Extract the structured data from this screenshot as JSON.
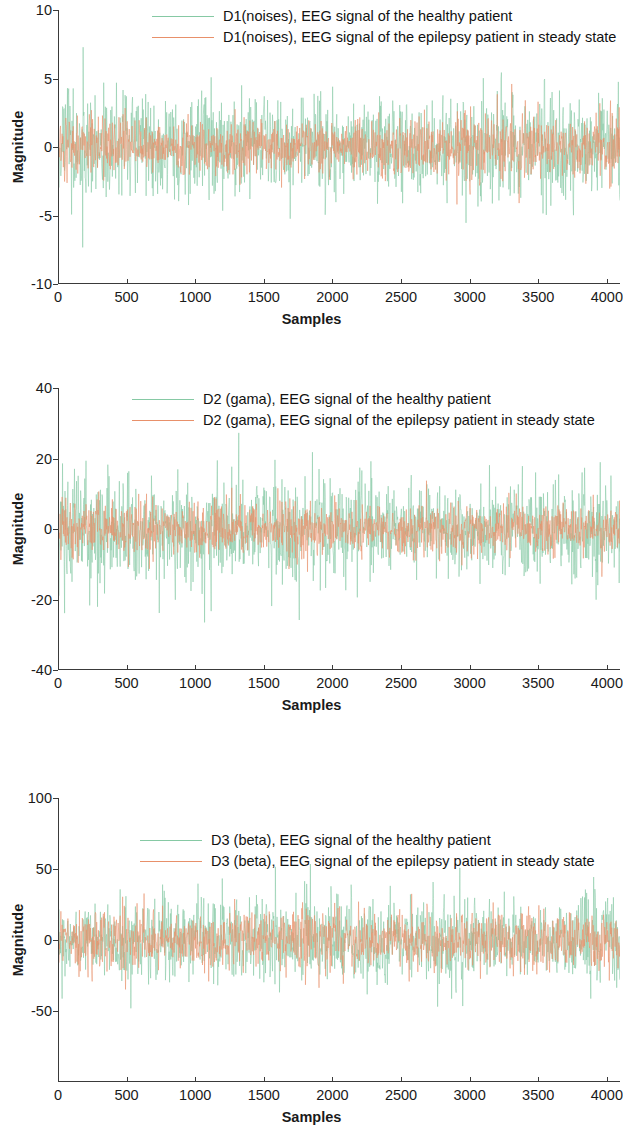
{
  "figure": {
    "background": "#ffffff",
    "series_colors": {
      "healthy": "#86c9a4",
      "epilepsy": "#e8906a"
    }
  },
  "chart_data": [
    {
      "type": "line",
      "id": "d1",
      "title": "",
      "xlabel": "Samples",
      "ylabel": "Magnitude",
      "xlim": [
        0,
        4096
      ],
      "ylim": [
        -10,
        10
      ],
      "xticks": [
        0,
        500,
        1000,
        1500,
        2000,
        2500,
        3000,
        3500,
        4000
      ],
      "xticklabels": [
        "0",
        "500",
        "1000",
        "1500",
        "2000",
        "2500",
        "3000",
        "3500",
        "4000"
      ],
      "yticks": [
        10,
        5,
        0,
        -5,
        -10
      ],
      "yticklabels": [
        "10",
        "5",
        "0",
        "-5",
        "-10"
      ],
      "grid": false,
      "legend_position": "top-center",
      "series": [
        {
          "name": "D1(noises), EEG signal of the healthy patient",
          "color": "#86c9a4",
          "amplitude": 4.2,
          "peak": 8.9,
          "seed": 11,
          "roughness": 0.95,
          "npoints": 4096
        },
        {
          "name": "D1(noises), EEG signal of the epilepsy patient in steady state",
          "color": "#e8906a",
          "amplitude": 1.9,
          "peak": 4.6,
          "seed": 23,
          "roughness": 0.9,
          "npoints": 4096
        }
      ]
    },
    {
      "type": "line",
      "id": "d2",
      "title": "",
      "xlabel": "Samples",
      "ylabel": "Magnitude",
      "xlim": [
        0,
        4096
      ],
      "ylim": [
        -40,
        40
      ],
      "xticks": [
        0,
        500,
        1000,
        1500,
        2000,
        2500,
        3000,
        3500,
        4000
      ],
      "xticklabels": [
        "0",
        "500",
        "1000",
        "1500",
        "2000",
        "2500",
        "3000",
        "3500",
        "4000"
      ],
      "yticks": [
        40,
        20,
        0,
        -20,
        -40
      ],
      "yticklabels": [
        "40",
        "20",
        "0",
        "-20",
        "-40"
      ],
      "grid": false,
      "legend_position": "top-center",
      "series": [
        {
          "name": "D2 (gama), EEG signal of the healthy patient",
          "color": "#86c9a4",
          "amplitude": 14.5,
          "peak": 33,
          "seed": 37,
          "roughness": 0.85,
          "npoints": 4096
        },
        {
          "name": "D2 (gama), EEG signal of the epilepsy patient in steady state",
          "color": "#e8906a",
          "amplitude": 6.5,
          "peak": 16,
          "seed": 53,
          "roughness": 0.8,
          "npoints": 4096
        }
      ]
    },
    {
      "type": "line",
      "id": "d3",
      "title": "",
      "xlabel": "Samples",
      "ylabel": "Magnitude",
      "xlim": [
        0,
        4096
      ],
      "ylim": [
        -100,
        100
      ],
      "xticks": [
        0,
        500,
        1000,
        1500,
        2000,
        2500,
        3000,
        3500,
        4000
      ],
      "xticklabels": [
        "0",
        "500",
        "1000",
        "1500",
        "2000",
        "2500",
        "3000",
        "3500",
        "4000"
      ],
      "yticks": [
        100,
        50,
        0,
        -50
      ],
      "yticklabels": [
        "100",
        "50",
        "0",
        "-50"
      ],
      "grid": false,
      "legend_position": "top-center",
      "series": [
        {
          "name": "D3 (beta), EEG signal of the healthy patient",
          "color": "#86c9a4",
          "amplitude": 26,
          "peak": 62,
          "seed": 71,
          "roughness": 0.6,
          "npoints": 4096
        },
        {
          "name": "D3 (beta), EEG signal of the epilepsy patient in steady state",
          "color": "#e8906a",
          "amplitude": 15,
          "peak": 38,
          "seed": 97,
          "roughness": 0.55,
          "npoints": 4096
        }
      ]
    }
  ]
}
